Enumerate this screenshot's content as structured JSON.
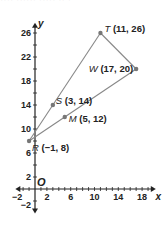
{
  "header_fragment": "···· ······ ····· ·· ·",
  "axes": {
    "x_label": "x",
    "y_label": "y",
    "origin_label": "O",
    "x_ticks": [
      "−2",
      "2",
      "6",
      "10",
      "14",
      "18"
    ],
    "y_ticks": [
      "−2",
      "2",
      "6",
      "10",
      "14",
      "18",
      "22",
      "26"
    ]
  },
  "points": [
    {
      "name": "R",
      "label": "R (−1, 8)",
      "x": -1,
      "y": 8
    },
    {
      "name": "S",
      "label": "S (3, 14)",
      "x": 3,
      "y": 14
    },
    {
      "name": "M",
      "label": "M (5, 12)",
      "x": 5,
      "y": 12
    },
    {
      "name": "T",
      "label": "T (11, 26)",
      "x": 11,
      "y": 26
    },
    {
      "name": "W",
      "label": "W (17, 20)",
      "x": 17,
      "y": 20
    }
  ],
  "segments": [
    [
      "R",
      "T"
    ],
    [
      "T",
      "W"
    ],
    [
      "W",
      "R"
    ]
  ],
  "colors": {
    "line": "#888888",
    "point": "#777777",
    "axis": "#222222",
    "text": "#222222"
  }
}
